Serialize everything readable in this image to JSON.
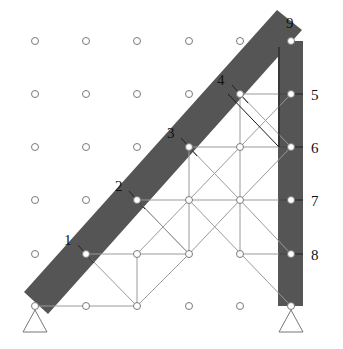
{
  "diagram": {
    "width": 343,
    "height": 349,
    "grid": {
      "cols_x": [
        35,
        86,
        137,
        189,
        240,
        291
      ],
      "rows_y": [
        41,
        94,
        147,
        200,
        254,
        306
      ],
      "node_radius": 3.5
    },
    "colors": {
      "member_fill": "#555555",
      "line": "#9a9a9a",
      "node_stroke": "#7a7a7a",
      "node_fill": "#ffffff",
      "tick": "#222222"
    },
    "members": [
      {
        "name": "diagonal-beam",
        "polygon": [
          [
            24,
            292
          ],
          [
            277,
            10
          ],
          [
            302,
            30
          ],
          [
            48,
            314
          ]
        ]
      },
      {
        "name": "vertical-column",
        "polygon": [
          [
            278,
            41
          ],
          [
            303,
            41
          ],
          [
            303,
            306
          ],
          [
            278,
            306
          ]
        ]
      }
    ],
    "beam_nodes": [
      {
        "id": "1",
        "c": 1,
        "r": 4,
        "label": "1",
        "label_pos": [
          64,
          245
        ]
      },
      {
        "id": "2",
        "c": 2,
        "r": 3,
        "label": "2",
        "label_pos": [
          115,
          191
        ]
      },
      {
        "id": "3",
        "c": 3,
        "r": 2,
        "label": "3",
        "label_pos": [
          167,
          138
        ]
      },
      {
        "id": "4",
        "c": 4,
        "r": 1,
        "label": "4",
        "label_pos": [
          217,
          85
        ]
      },
      {
        "id": "9",
        "c": 5,
        "r": 0,
        "label": "9",
        "label_pos": [
          286,
          28
        ]
      },
      {
        "id": "5",
        "c": 5,
        "r": 1,
        "label": "5",
        "label_pos": [
          311,
          100
        ]
      },
      {
        "id": "6",
        "c": 5,
        "r": 2,
        "label": "6",
        "label_pos": [
          311,
          153
        ]
      },
      {
        "id": "7",
        "c": 5,
        "r": 3,
        "label": "7",
        "label_pos": [
          311,
          206
        ]
      },
      {
        "id": "8",
        "c": 5,
        "r": 4,
        "label": "8",
        "label_pos": [
          311,
          260
        ]
      }
    ],
    "grid_nodes": [
      [
        0,
        0
      ],
      [
        1,
        0
      ],
      [
        2,
        0
      ],
      [
        3,
        0
      ],
      [
        4,
        0
      ],
      [
        0,
        1
      ],
      [
        1,
        1
      ],
      [
        2,
        1
      ],
      [
        3,
        1
      ],
      [
        0,
        2
      ],
      [
        1,
        2
      ],
      [
        2,
        2
      ],
      [
        4,
        2
      ],
      [
        0,
        3
      ],
      [
        1,
        3
      ],
      [
        3,
        3
      ],
      [
        4,
        3
      ],
      [
        0,
        4
      ],
      [
        2,
        4
      ],
      [
        3,
        4
      ],
      [
        4,
        4
      ],
      [
        1,
        5
      ],
      [
        2,
        5
      ],
      [
        3,
        5
      ],
      [
        4,
        5
      ]
    ],
    "support_nodes": [
      [
        0,
        5
      ],
      [
        5,
        5
      ]
    ],
    "edges": [
      [
        [
          0,
          5
        ],
        [
          1,
          5
        ]
      ],
      [
        [
          1,
          5
        ],
        [
          2,
          5
        ]
      ],
      [
        [
          1,
          4
        ],
        [
          2,
          4
        ]
      ],
      [
        [
          2,
          4
        ],
        [
          3,
          4
        ]
      ],
      [
        [
          4,
          4
        ],
        [
          5,
          4
        ]
      ],
      [
        [
          2,
          3
        ],
        [
          3,
          3
        ]
      ],
      [
        [
          3,
          3
        ],
        [
          4,
          3
        ]
      ],
      [
        [
          4,
          3
        ],
        [
          5,
          3
        ]
      ],
      [
        [
          3,
          2
        ],
        [
          4,
          2
        ]
      ],
      [
        [
          4,
          2
        ],
        [
          5,
          2
        ]
      ],
      [
        [
          4,
          1
        ],
        [
          5,
          1
        ]
      ],
      [
        [
          3,
          2
        ],
        [
          3,
          3
        ]
      ],
      [
        [
          3,
          3
        ],
        [
          3,
          4
        ]
      ],
      [
        [
          4,
          1
        ],
        [
          4,
          2
        ]
      ],
      [
        [
          4,
          2
        ],
        [
          4,
          3
        ]
      ],
      [
        [
          4,
          3
        ],
        [
          4,
          4
        ]
      ],
      [
        [
          1,
          4
        ],
        [
          2,
          5
        ]
      ],
      [
        [
          2,
          5
        ],
        [
          3,
          4
        ]
      ],
      [
        [
          2,
          3
        ],
        [
          3,
          4
        ]
      ],
      [
        [
          3,
          4
        ],
        [
          4,
          3
        ]
      ],
      [
        [
          2,
          4
        ],
        [
          3,
          3
        ]
      ],
      [
        [
          3,
          3
        ],
        [
          4,
          2
        ]
      ],
      [
        [
          3,
          2
        ],
        [
          4,
          3
        ]
      ],
      [
        [
          4,
          3
        ],
        [
          5,
          4
        ]
      ],
      [
        [
          4,
          2
        ],
        [
          5,
          1
        ]
      ],
      [
        [
          4,
          1
        ],
        [
          5,
          2
        ]
      ],
      [
        [
          3,
          3
        ],
        [
          5,
          5
        ]
      ],
      [
        [
          2,
          5
        ],
        [
          2,
          4
        ]
      ],
      [
        [
          4,
          3
        ],
        [
          5,
          2
        ]
      ],
      [
        [
          3,
          4
        ],
        [
          2,
          3
        ]
      ]
    ],
    "dark_edges": [
      [
        [
          5,
          0
        ],
        [
          5,
          1
        ]
      ],
      [
        [
          5,
          1
        ],
        [
          5,
          2
        ]
      ],
      [
        [
          4,
          1
        ],
        [
          5,
          2
        ]
      ]
    ],
    "ticks": [
      {
        "at": [
          1,
          4
        ],
        "dir": "beam"
      },
      {
        "at": [
          2,
          3
        ],
        "dir": "beam"
      },
      {
        "at": [
          3,
          2
        ],
        "dir": "beam"
      },
      {
        "at": [
          4,
          1
        ],
        "dir": "beam"
      },
      {
        "at": [
          5,
          1
        ],
        "dir": "col"
      },
      {
        "at": [
          5,
          2
        ],
        "dir": "col"
      },
      {
        "at": [
          5,
          3
        ],
        "dir": "col"
      },
      {
        "at": [
          5,
          4
        ],
        "dir": "col"
      }
    ],
    "supports": [
      {
        "name": "left-pin-support",
        "c": 0,
        "r": 5
      },
      {
        "name": "right-pin-support",
        "c": 5,
        "r": 5
      }
    ]
  }
}
